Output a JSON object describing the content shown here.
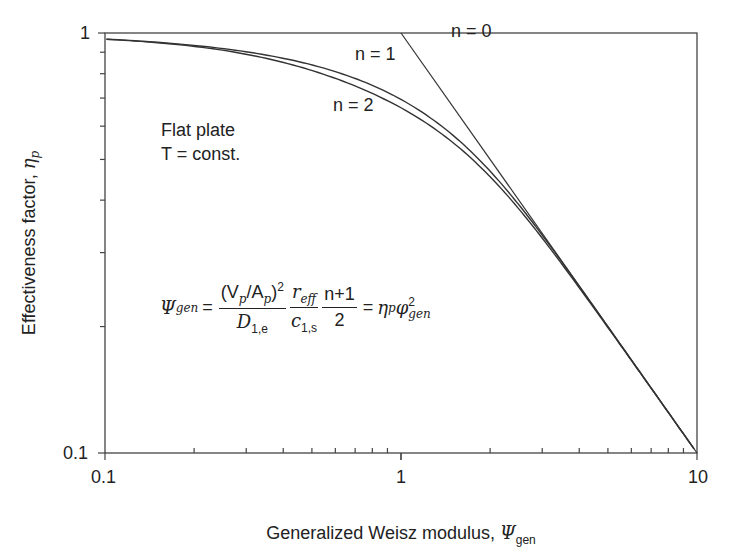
{
  "chart_data": {
    "type": "line",
    "title": "",
    "xlabel": "Generalized Weisz modulus, Ψ_gen",
    "ylabel": "Effectiveness factor, η_p",
    "xscale": "log",
    "yscale": "log",
    "xlim": [
      0.1,
      10
    ],
    "ylim": [
      0.1,
      1
    ],
    "x_ticks": [
      "0.1",
      "1",
      "10"
    ],
    "y_ticks": [
      "0.1",
      "1"
    ],
    "grid": false,
    "legend": "none (inline labels)",
    "series": [
      {
        "name": "n = 0",
        "description": "zero-order: η_p = 1 for Ψ ≤ 1, η_p = 1/Ψ for Ψ > 1",
        "points": [
          [
            1.0,
            1.0
          ],
          [
            2.5,
            0.4
          ],
          [
            10,
            0.1
          ]
        ]
      },
      {
        "name": "n = 1",
        "description": "first-order flat plate",
        "points": [
          [
            0.1,
            0.97
          ],
          [
            0.3,
            0.91
          ],
          [
            0.5,
            0.84
          ],
          [
            1.0,
            0.71
          ],
          [
            2.0,
            0.49
          ],
          [
            3.0,
            0.33
          ],
          [
            5.0,
            0.2
          ],
          [
            10,
            0.1
          ]
        ]
      },
      {
        "name": "n = 2",
        "description": "second-order flat plate",
        "points": [
          [
            0.1,
            0.97
          ],
          [
            0.3,
            0.9
          ],
          [
            0.5,
            0.82
          ],
          [
            1.0,
            0.68
          ],
          [
            2.0,
            0.47
          ],
          [
            3.0,
            0.33
          ],
          [
            5.0,
            0.2
          ],
          [
            10,
            0.1
          ]
        ]
      }
    ],
    "annotations": [
      {
        "text": "n = 0",
        "x": 1.55,
        "y": 0.86
      },
      {
        "text": "n = 1",
        "x": 0.9,
        "y": 0.87
      },
      {
        "text": "n = 2",
        "x": 0.76,
        "y": 0.66
      },
      {
        "text": "Flat plate",
        "x": 0.14,
        "y": 0.6
      },
      {
        "text": "T = const.",
        "x": 0.14,
        "y": 0.53
      },
      {
        "text": "Ψ_gen = ((V_p/A_p)^2 / D_1,e) · (r_eff / c_1,s) · ((n+1)/2) = η_p φ_gen^2",
        "x": 0.12,
        "y": 0.22
      }
    ]
  },
  "labels": {
    "x_axis": "Generalized Weisz modulus, ",
    "x_axis_symbol": "Ψ",
    "x_axis_sub": "gen",
    "y_axis": "Effectiveness factor, ",
    "y_axis_symbol": "η",
    "y_axis_sub": "p",
    "x_tick_01": "0.1",
    "x_tick_1": "1",
    "x_tick_10": "10",
    "y_tick_1": "1",
    "y_tick_01": "0.1",
    "n0": "n = 0",
    "n1": "n = 1",
    "n2": "n = 2",
    "geometry": "Flat plate",
    "condition": "T = const."
  },
  "formula": {
    "lhs": "Ψ",
    "lhs_sub": "gen",
    "eq": "=",
    "f1_num": "(V",
    "f1_num_sub1": "p",
    "f1_num_mid": "/A",
    "f1_num_sub2": "p",
    "f1_num_end": ")",
    "f1_num_sup": "2",
    "f1_den": "D",
    "f1_den_sub": "1,e",
    "f2_num": "r",
    "f2_num_sub": "eff",
    "f2_den": "c",
    "f2_den_sub": "1,s",
    "f3_num": "n+1",
    "f3_den": "2",
    "rhs_eq": "=",
    "rhs_eta": "η",
    "rhs_eta_sub": "p",
    "rhs_phi": "φ",
    "rhs_phi_sup": "2",
    "rhs_phi_sub": "gen"
  }
}
